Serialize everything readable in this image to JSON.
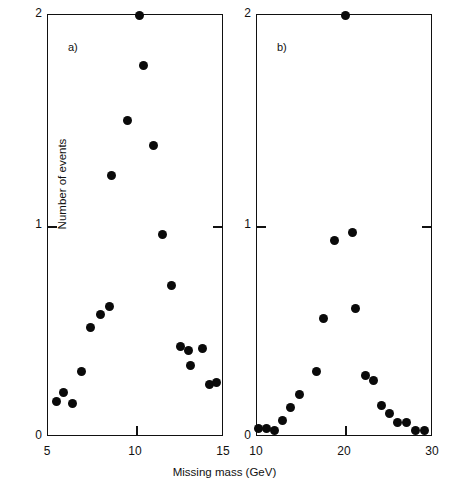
{
  "figure": {
    "xlabel": "Missing mass (GeV)",
    "ylabel": "Number of events",
    "panel_a_label": "a)",
    "panel_b_label": "b)",
    "marker_color": "#0a0a0a",
    "axis_color": "#111111"
  },
  "chart_data": [
    {
      "type": "scatter",
      "panel": "a)",
      "title": "",
      "xlabel": "Missing mass (GeV)",
      "ylabel": "Number of events",
      "xlim": [
        5,
        15
      ],
      "ylim": [
        0,
        2
      ],
      "xticks": [
        5,
        10,
        15
      ],
      "xticklabels": [
        "5",
        "10",
        "15"
      ],
      "yticks": [
        0,
        1,
        2
      ],
      "yticklabels": [
        "0",
        "1",
        "2"
      ],
      "grid": false,
      "legend": "none",
      "points": [
        {
          "x": 5.5,
          "y": 0.17
        },
        {
          "x": 5.9,
          "y": 0.21
        },
        {
          "x": 6.4,
          "y": 0.16
        },
        {
          "x": 6.9,
          "y": 0.31
        },
        {
          "x": 7.4,
          "y": 0.52
        },
        {
          "x": 8.0,
          "y": 0.58
        },
        {
          "x": 8.5,
          "y": 0.62
        },
        {
          "x": 8.6,
          "y": 1.24
        },
        {
          "x": 9.5,
          "y": 1.5
        },
        {
          "x": 10.2,
          "y": 2.0
        },
        {
          "x": 10.4,
          "y": 1.76
        },
        {
          "x": 11.0,
          "y": 1.38
        },
        {
          "x": 11.5,
          "y": 0.96
        },
        {
          "x": 12.0,
          "y": 0.72
        },
        {
          "x": 12.5,
          "y": 0.43
        },
        {
          "x": 13.0,
          "y": 0.41
        },
        {
          "x": 13.1,
          "y": 0.34
        },
        {
          "x": 13.8,
          "y": 0.42
        },
        {
          "x": 14.2,
          "y": 0.25
        },
        {
          "x": 14.6,
          "y": 0.26
        }
      ]
    },
    {
      "type": "scatter",
      "panel": "b)",
      "title": "",
      "xlabel": "Missing mass (GeV)",
      "ylabel": "Number of events",
      "xlim": [
        10,
        30
      ],
      "ylim": [
        0,
        2
      ],
      "xticks": [
        10,
        20,
        30
      ],
      "xticklabels": [
        "10",
        "20",
        "30"
      ],
      "yticks": [
        0,
        1,
        2
      ],
      "yticklabels": [
        "0",
        "1",
        "2"
      ],
      "grid": false,
      "legend": "none",
      "points": [
        {
          "x": 10.2,
          "y": 0.04
        },
        {
          "x": 11.1,
          "y": 0.04
        },
        {
          "x": 12.0,
          "y": 0.03
        },
        {
          "x": 12.9,
          "y": 0.08
        },
        {
          "x": 13.8,
          "y": 0.14
        },
        {
          "x": 14.8,
          "y": 0.2
        },
        {
          "x": 16.8,
          "y": 0.31
        },
        {
          "x": 17.5,
          "y": 0.56
        },
        {
          "x": 18.8,
          "y": 0.93
        },
        {
          "x": 20.0,
          "y": 2.0
        },
        {
          "x": 20.9,
          "y": 0.97
        },
        {
          "x": 21.2,
          "y": 0.61
        },
        {
          "x": 22.3,
          "y": 0.29
        },
        {
          "x": 23.2,
          "y": 0.27
        },
        {
          "x": 24.2,
          "y": 0.15
        },
        {
          "x": 25.1,
          "y": 0.11
        },
        {
          "x": 26.0,
          "y": 0.07
        },
        {
          "x": 27.0,
          "y": 0.07
        },
        {
          "x": 28.0,
          "y": 0.03
        },
        {
          "x": 29.0,
          "y": 0.03
        }
      ]
    }
  ]
}
